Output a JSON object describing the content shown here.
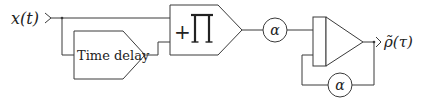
{
  "diagram": {
    "type": "block-diagram",
    "input": {
      "label": "x(t)"
    },
    "output": {
      "label": "ρ̃(τ)"
    },
    "blocks": [
      {
        "id": "time-delay",
        "label": "Time delay",
        "shape": "pentagon"
      },
      {
        "id": "product",
        "label_plus": "+",
        "label_symbol": "∏",
        "shape": "pentagon"
      },
      {
        "id": "gain-1",
        "label": "α",
        "shape": "circle"
      },
      {
        "id": "integrator",
        "label": "",
        "shape": "triangle-with-summing-bar"
      },
      {
        "id": "gain-feedback",
        "label": "α",
        "shape": "circle"
      }
    ],
    "connections": [
      {
        "from": "input",
        "to": "product"
      },
      {
        "from": "input",
        "to": "time-delay"
      },
      {
        "from": "time-delay",
        "to": "product"
      },
      {
        "from": "product",
        "to": "gain-1"
      },
      {
        "from": "gain-1",
        "to": "integrator"
      },
      {
        "from": "integrator",
        "to": "output"
      },
      {
        "from": "integrator",
        "to": "gain-feedback"
      },
      {
        "from": "gain-feedback",
        "to": "integrator"
      }
    ],
    "colors": {
      "stroke": "#3a3a3a",
      "background": "#ffffff",
      "text": "#222222"
    }
  }
}
